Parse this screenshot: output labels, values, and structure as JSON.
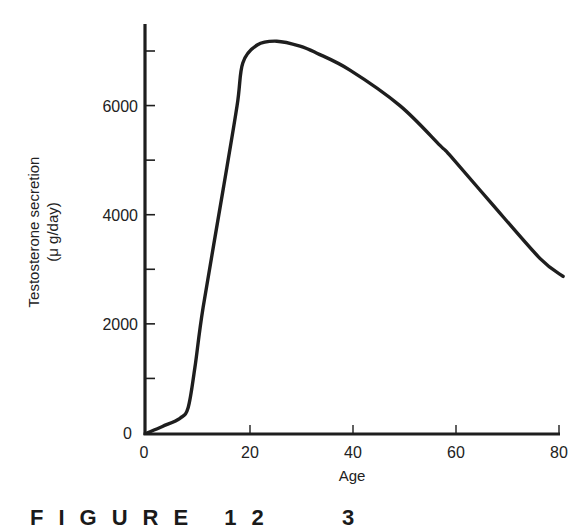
{
  "figure": {
    "caption": "FIGURE 12   3"
  },
  "chart_data": {
    "type": "line",
    "title": "",
    "xlabel": "Age",
    "ylabel": "Testosterone secretion",
    "ylabel_units": "(μ g/day)",
    "xlim": [
      0,
      80
    ],
    "ylim": [
      0,
      7000
    ],
    "x_ticks": [
      0,
      20,
      40,
      60,
      80
    ],
    "x_tick_labels": [
      "0",
      "20",
      "40",
      "60",
      "80"
    ],
    "y_ticks": [
      0,
      1000,
      2000,
      3000,
      4000,
      5000,
      6000,
      7000
    ],
    "y_tick_labels": [
      "0",
      "",
      "2000",
      "",
      "4000",
      "",
      "6000",
      ""
    ],
    "grid": false,
    "legend": null,
    "series": [
      {
        "name": "Testosterone secretion",
        "color": "#1e1e1e",
        "x": [
          0,
          3,
          6.4,
          8,
          9.3,
          10.9,
          14.8,
          17.5,
          18.6,
          21.4,
          25.2,
          29.7,
          33,
          39.4,
          49.1,
          56.9,
          58.8,
          66.6,
          76.3,
          80.8
        ],
        "y": [
          0,
          120,
          270,
          470,
          1200,
          2300,
          4470,
          6000,
          6780,
          7110,
          7180,
          7090,
          6960,
          6650,
          6000,
          5270,
          5090,
          4240,
          3200,
          2870
        ]
      }
    ]
  }
}
